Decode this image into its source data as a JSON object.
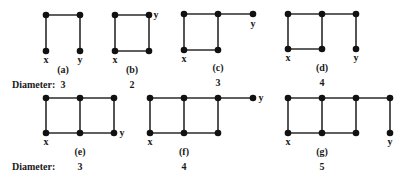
{
  "row_labels": {
    "row1": "Diameter:",
    "row2": "Diameter:"
  },
  "graphs": [
    {
      "id": "a",
      "caption": "(a)",
      "diameter": "3",
      "nodes": [
        [
          46,
          15
        ],
        [
          80,
          15
        ],
        [
          46,
          51
        ],
        [
          80,
          51
        ]
      ],
      "edges": [
        [
          0,
          1
        ],
        [
          0,
          2
        ],
        [
          1,
          3
        ]
      ],
      "x_label": {
        "text": "x",
        "pos": [
          46,
          63
        ]
      },
      "y_label": {
        "text": "y",
        "pos": [
          80,
          63
        ]
      },
      "caption_pos": [
        63,
        73
      ],
      "diameter_pos": [
        63,
        88
      ]
    },
    {
      "id": "b",
      "caption": "(b)",
      "diameter": "2",
      "nodes": [
        [
          115,
          15
        ],
        [
          149,
          15
        ],
        [
          115,
          51
        ],
        [
          149,
          51
        ]
      ],
      "edges": [
        [
          0,
          1
        ],
        [
          0,
          2
        ],
        [
          1,
          3
        ],
        [
          2,
          3
        ]
      ],
      "x_label": {
        "text": "x",
        "pos": [
          115,
          63
        ]
      },
      "y_label": {
        "text": "y",
        "pos": [
          156,
          18
        ]
      },
      "caption_pos": [
        132,
        73
      ],
      "diameter_pos": [
        132,
        88
      ]
    },
    {
      "id": "c",
      "caption": "(c)",
      "diameter": "3",
      "nodes": [
        [
          184,
          14
        ],
        [
          218,
          14
        ],
        [
          253,
          14
        ],
        [
          184,
          50
        ],
        [
          218,
          50
        ]
      ],
      "edges": [
        [
          0,
          1
        ],
        [
          1,
          2
        ],
        [
          0,
          3
        ],
        [
          1,
          4
        ],
        [
          3,
          4
        ]
      ],
      "x_label": {
        "text": "x",
        "pos": [
          184,
          62
        ]
      },
      "y_label": {
        "text": "y",
        "pos": [
          253,
          27
        ]
      },
      "caption_pos": [
        218,
        71
      ],
      "diameter_pos": [
        218,
        86
      ]
    },
    {
      "id": "d",
      "caption": "(d)",
      "diameter": "4",
      "nodes": [
        [
          288,
          14
        ],
        [
          322,
          14
        ],
        [
          356,
          14
        ],
        [
          288,
          49
        ],
        [
          322,
          49
        ],
        [
          356,
          49
        ]
      ],
      "edges": [
        [
          0,
          1
        ],
        [
          1,
          2
        ],
        [
          0,
          3
        ],
        [
          1,
          4
        ],
        [
          3,
          4
        ],
        [
          2,
          5
        ]
      ],
      "x_label": {
        "text": "x",
        "pos": [
          288,
          61
        ]
      },
      "y_label": {
        "text": "y",
        "pos": [
          356,
          61
        ]
      },
      "caption_pos": [
        322,
        71
      ],
      "diameter_pos": [
        322,
        86
      ]
    },
    {
      "id": "e",
      "caption": "(e)",
      "diameter": "3",
      "nodes": [
        [
          46,
          98
        ],
        [
          80,
          98
        ],
        [
          114,
          98
        ],
        [
          46,
          133
        ],
        [
          80,
          133
        ],
        [
          114,
          133
        ]
      ],
      "edges": [
        [
          0,
          1
        ],
        [
          1,
          2
        ],
        [
          0,
          3
        ],
        [
          1,
          4
        ],
        [
          2,
          5
        ],
        [
          3,
          4
        ],
        [
          4,
          5
        ]
      ],
      "x_label": {
        "text": "x",
        "pos": [
          46,
          145
        ]
      },
      "y_label": {
        "text": "y",
        "pos": [
          122,
          136
        ]
      },
      "caption_pos": [
        80,
        155
      ],
      "diameter_pos": [
        80,
        170
      ]
    },
    {
      "id": "f",
      "caption": "(f)",
      "diameter": "4",
      "nodes": [
        [
          150,
          98
        ],
        [
          184,
          98
        ],
        [
          218,
          98
        ],
        [
          253,
          98
        ],
        [
          150,
          133
        ],
        [
          184,
          133
        ],
        [
          218,
          133
        ]
      ],
      "edges": [
        [
          0,
          1
        ],
        [
          1,
          2
        ],
        [
          2,
          3
        ],
        [
          0,
          4
        ],
        [
          1,
          5
        ],
        [
          2,
          6
        ],
        [
          4,
          5
        ],
        [
          5,
          6
        ]
      ],
      "x_label": {
        "text": "x",
        "pos": [
          150,
          145
        ]
      },
      "y_label": {
        "text": "y",
        "pos": [
          261,
          101
        ]
      },
      "caption_pos": [
        184,
        155
      ],
      "diameter_pos": [
        184,
        170
      ]
    },
    {
      "id": "g",
      "caption": "(g)",
      "diameter": "5",
      "nodes": [
        [
          288,
          98
        ],
        [
          322,
          98
        ],
        [
          356,
          98
        ],
        [
          390,
          98
        ],
        [
          288,
          133
        ],
        [
          322,
          133
        ],
        [
          356,
          133
        ],
        [
          390,
          133
        ]
      ],
      "edges": [
        [
          0,
          1
        ],
        [
          1,
          2
        ],
        [
          2,
          3
        ],
        [
          0,
          4
        ],
        [
          1,
          5
        ],
        [
          2,
          6
        ],
        [
          3,
          7
        ],
        [
          4,
          5
        ],
        [
          5,
          6
        ]
      ],
      "x_label": {
        "text": "x",
        "pos": [
          288,
          145
        ]
      },
      "y_label": {
        "text": "y",
        "pos": [
          390,
          145
        ]
      },
      "caption_pos": [
        322,
        155
      ],
      "diameter_pos": [
        322,
        170
      ]
    }
  ],
  "row_label_pos": {
    "row1": [
      12,
      88
    ],
    "row2": [
      12,
      170
    ]
  }
}
